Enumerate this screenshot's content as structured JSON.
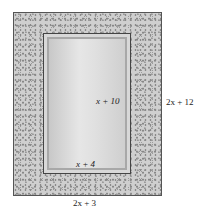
{
  "diagram": {
    "inner_height_label": "x + 10",
    "inner_width_label": "x + 4",
    "outer_height_label": "2x + 12",
    "outer_width_label": "2x + 3"
  }
}
